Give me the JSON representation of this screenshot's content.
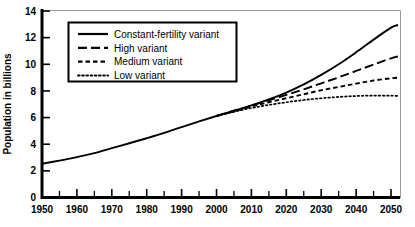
{
  "chart_data": {
    "type": "line",
    "title": "",
    "xlabel": "",
    "ylabel": "Population in billions",
    "xlim": [
      1950,
      2052
    ],
    "ylim": [
      0,
      14
    ],
    "grid": false,
    "legend_position": "top-left",
    "x_ticks": [
      "1950",
      "1960",
      "1970",
      "1980",
      "1990",
      "2000",
      "2010",
      "2020",
      "2030",
      "2040",
      "2050"
    ],
    "x_tick_values": [
      1950,
      1960,
      1970,
      1980,
      1990,
      2000,
      2010,
      2020,
      2030,
      2040,
      2050
    ],
    "x_minor_tick_values": [
      1955,
      1965,
      1975,
      1985,
      1995,
      2005,
      2015,
      2025,
      2035,
      2045
    ],
    "y_ticks": [
      "0",
      "2",
      "4",
      "6",
      "8",
      "10",
      "12",
      "14"
    ],
    "y_tick_values": [
      0,
      2,
      4,
      6,
      8,
      10,
      12,
      14
    ],
    "x": [
      1950,
      1955,
      1960,
      1965,
      1970,
      1975,
      1980,
      1985,
      1990,
      1995,
      2000,
      2005,
      2010,
      2015,
      2020,
      2025,
      2030,
      2035,
      2040,
      2045,
      2050,
      2052
    ],
    "series": [
      {
        "name": "Constant-fertility variant",
        "style": "solid",
        "color": "#000000",
        "values": [
          2.53,
          2.77,
          3.03,
          3.33,
          3.7,
          4.07,
          4.45,
          4.85,
          5.29,
          5.71,
          6.12,
          6.51,
          6.91,
          7.36,
          7.88,
          8.49,
          9.2,
          10.0,
          10.9,
          11.85,
          12.75,
          12.95
        ]
      },
      {
        "name": "High variant",
        "style": "dashed-long",
        "color": "#000000",
        "values": [
          2.53,
          2.77,
          3.03,
          3.33,
          3.7,
          4.07,
          4.45,
          4.85,
          5.29,
          5.71,
          6.12,
          6.51,
          6.89,
          7.3,
          7.7,
          8.12,
          8.57,
          9.02,
          9.5,
          9.98,
          10.45,
          10.6
        ]
      },
      {
        "name": "Medium variant",
        "style": "dashed-short",
        "color": "#000000",
        "values": [
          2.53,
          2.77,
          3.03,
          3.33,
          3.7,
          4.07,
          4.45,
          4.85,
          5.29,
          5.71,
          6.12,
          6.47,
          6.83,
          7.15,
          7.45,
          7.75,
          8.05,
          8.3,
          8.55,
          8.78,
          8.95,
          9.0
        ]
      },
      {
        "name": "Low variant",
        "style": "dotted",
        "color": "#000000",
        "values": [
          2.53,
          2.77,
          3.03,
          3.33,
          3.7,
          4.07,
          4.45,
          4.85,
          5.29,
          5.71,
          6.12,
          6.43,
          6.72,
          6.95,
          7.15,
          7.32,
          7.45,
          7.55,
          7.62,
          7.65,
          7.64,
          7.62
        ]
      }
    ],
    "legend": [
      {
        "label": "Constant-fertility variant",
        "style": "solid"
      },
      {
        "label": "High variant",
        "style": "dashed-long"
      },
      {
        "label": "Medium variant",
        "style": "dashed-short"
      },
      {
        "label": "Low variant",
        "style": "dotted"
      }
    ]
  }
}
